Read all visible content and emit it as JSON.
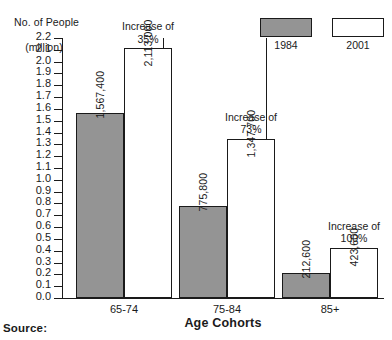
{
  "chart_data": {
    "type": "bar",
    "title": "",
    "ylabel": "No. of People (million)",
    "ylabel_line1": "No. of People",
    "ylabel_line2": "(million)",
    "xlabel": "Age Cohorts",
    "categories": [
      "65-74",
      "75-84",
      "85+"
    ],
    "ylim": [
      0.0,
      2.2
    ],
    "ytick_step": 0.1,
    "yticks": [
      "2.2",
      "2.1",
      "2.0",
      "1.9",
      "1.8",
      "1.7",
      "1.6",
      "1.5",
      "1.4",
      "1.3",
      "1.2",
      "1.1",
      "1.0",
      "0.9",
      "0.8",
      "0.7",
      "0.6",
      "0.5",
      "0.4",
      "0.3",
      "0.2",
      "0.1",
      "0.0"
    ],
    "grid": false,
    "legend_position": "top-right",
    "series": [
      {
        "name": "1984",
        "color": "#949494",
        "values": [
          1567400,
          775800,
          212600
        ],
        "value_labels": [
          "1,567,400",
          "775,800",
          "212,600"
        ]
      },
      {
        "name": "2001",
        "color": "#ffffff",
        "values": [
          2113000,
          1347700,
          423600
        ],
        "value_labels": [
          "2,113,000",
          "1,347,700",
          "423,600"
        ]
      }
    ],
    "annotations": [
      {
        "category": "65-74",
        "line1": "Increase of",
        "line2": "35%"
      },
      {
        "category": "75-84",
        "line1": "Increase of",
        "line2": "73%"
      },
      {
        "category": "85+",
        "line1": "Increase of",
        "line2": "100%"
      }
    ]
  },
  "legend": {
    "items": [
      {
        "label": "1984",
        "swatch": "gray"
      },
      {
        "label": "2001",
        "swatch": "white"
      }
    ]
  },
  "footer": {
    "source_label": "Source:"
  }
}
